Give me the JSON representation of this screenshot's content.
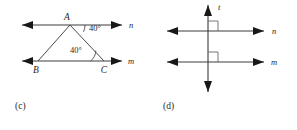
{
  "page": {
    "background_color": "#ffffff",
    "ink_color": "#1f1f1f",
    "line_color": "#3c3c3c"
  },
  "figures": [
    {
      "id": "c",
      "caption": "(c)",
      "description": "Triangle ABC between two parallel lines n and m",
      "lines": [
        {
          "name": "n",
          "label": "n",
          "role": "upper-parallel-line",
          "double_arrow": true
        },
        {
          "name": "m",
          "label": "m",
          "role": "lower-parallel-line",
          "double_arrow": true
        }
      ],
      "vertices": [
        {
          "label": "A",
          "on_line": "n",
          "x": 70,
          "y": 24
        },
        {
          "label": "B",
          "on_line": "m",
          "x": 38,
          "y": 60
        },
        {
          "label": "C",
          "on_line": "m",
          "x": 104,
          "y": 60
        }
      ],
      "angles": [
        {
          "label": "40°",
          "value": 40,
          "unit": "degrees",
          "at_vertex": "A",
          "position": "right-of-A-below-line-n"
        },
        {
          "label": "40°",
          "value": 40,
          "unit": "degrees",
          "at_vertex": "C",
          "position": "left-of-C-above-line-m"
        }
      ]
    },
    {
      "id": "d",
      "caption": "(d)",
      "description": "Transversal t perpendicular to two parallel lines n and m",
      "lines": [
        {
          "name": "t",
          "label": "t",
          "role": "vertical-transversal",
          "double_arrow": true
        },
        {
          "name": "n",
          "label": "n",
          "role": "upper-parallel-line",
          "double_arrow": true
        },
        {
          "name": "m",
          "label": "m",
          "role": "lower-parallel-line",
          "double_arrow": true
        }
      ],
      "right_angle_marks": [
        {
          "at_intersection": "t-and-n",
          "quadrant": "upper-right"
        },
        {
          "at_intersection": "t-and-m",
          "quadrant": "upper-right"
        }
      ]
    }
  ]
}
